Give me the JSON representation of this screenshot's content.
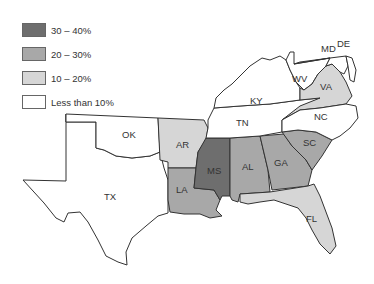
{
  "legend": {
    "items": [
      {
        "label": "30 – 40%",
        "color": "#6e6e6e"
      },
      {
        "label": "20 – 30%",
        "color": "#a8a8a8"
      },
      {
        "label": "10 – 20%",
        "color": "#d6d6d6"
      },
      {
        "label": "Less than 10%",
        "color": "#ffffff"
      }
    ]
  },
  "states": {
    "TX": {
      "label": "TX",
      "category": "Less than 10%"
    },
    "OK": {
      "label": "OK",
      "category": "Less than 10%"
    },
    "AR": {
      "label": "AR",
      "category": "10 – 20%"
    },
    "LA": {
      "label": "LA",
      "category": "20 – 30%"
    },
    "MS": {
      "label": "MS",
      "category": "30 – 40%"
    },
    "AL": {
      "label": "AL",
      "category": "20 – 30%"
    },
    "GA": {
      "label": "GA",
      "category": "20 – 30%"
    },
    "SC": {
      "label": "SC",
      "category": "20 – 30%"
    },
    "FL": {
      "label": "FL",
      "category": "10 – 20%"
    },
    "TN": {
      "label": "TN",
      "category": "Less than 10%"
    },
    "KY": {
      "label": "KY",
      "category": "Less than 10%"
    },
    "NC": {
      "label": "NC",
      "category": "10 – 20%"
    },
    "VA": {
      "label": "VA",
      "category": "10 – 20%"
    },
    "WV": {
      "label": "WV",
      "category": "Less than 10%"
    },
    "MD": {
      "label": "MD",
      "category": "Less than 10%"
    },
    "DE": {
      "label": "DE",
      "category": "Less than 10%"
    }
  }
}
